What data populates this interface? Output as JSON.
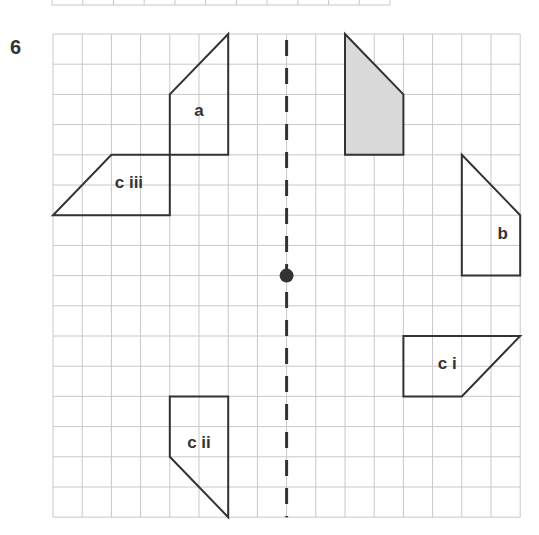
{
  "question": {
    "number": "6"
  },
  "grid": {
    "cols": 16,
    "rows": 16,
    "origin_x": 53,
    "origin_y": 34,
    "cell_w": 29.2,
    "cell_h": 30.2,
    "line_color": "#c8c8c8",
    "top_strip": {
      "x0": 52,
      "x1": 390,
      "y": 5,
      "cols": 11
    }
  },
  "mirror_line": {
    "col": 8,
    "style": "dashed",
    "color": "#333333"
  },
  "centre_point": {
    "col": 8,
    "row": 8,
    "color": "#333333"
  },
  "shapes": [
    {
      "id": "object",
      "label": "",
      "shaded": true,
      "points": [
        [
          10,
          0
        ],
        [
          12,
          2
        ],
        [
          12,
          4
        ],
        [
          10,
          4
        ]
      ],
      "label_pos": [
        11,
        2.8
      ]
    },
    {
      "id": "a",
      "label": "a",
      "shaded": false,
      "points": [
        [
          6,
          0
        ],
        [
          6,
          4
        ],
        [
          4,
          4
        ],
        [
          4,
          2
        ]
      ],
      "label_pos": [
        5,
        2.7
      ]
    },
    {
      "id": "c-iii",
      "label": "c iii",
      "shaded": false,
      "points": [
        [
          4,
          4
        ],
        [
          4,
          6
        ],
        [
          0,
          6
        ],
        [
          2,
          4
        ]
      ],
      "label_pos": [
        2.6,
        5.1
      ]
    },
    {
      "id": "b",
      "label": "b",
      "shaded": false,
      "points": [
        [
          14,
          4
        ],
        [
          16,
          6
        ],
        [
          16,
          8
        ],
        [
          14,
          8
        ]
      ],
      "label_pos": [
        15.4,
        6.8
      ]
    },
    {
      "id": "c-i",
      "label": "c i",
      "shaded": false,
      "points": [
        [
          12,
          10
        ],
        [
          16,
          10
        ],
        [
          14,
          12
        ],
        [
          12,
          12
        ]
      ],
      "label_pos": [
        13.5,
        11.1
      ]
    },
    {
      "id": "c-ii",
      "label": "c ii",
      "shaded": false,
      "points": [
        [
          4,
          12
        ],
        [
          6,
          12
        ],
        [
          6,
          16
        ],
        [
          4,
          14
        ]
      ],
      "label_pos": [
        5,
        13.7
      ]
    }
  ],
  "colors": {
    "outline": "#333333",
    "shade": "#d9d9d9"
  }
}
